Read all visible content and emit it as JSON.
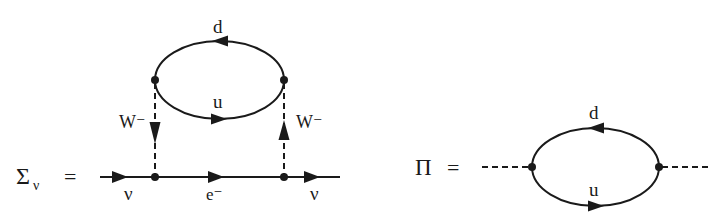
{
  "diagrams": [
    {
      "id": "self-energy",
      "lhs": {
        "symbol": "Σ",
        "subscript": "ν",
        "equals": "="
      },
      "labels": {
        "loop_top_quark": "d",
        "loop_bottom_quark": "u",
        "left_boson": "W⁻",
        "right_boson": "W⁻",
        "incoming": "ν",
        "internal": "e⁻",
        "outgoing": "ν"
      }
    },
    {
      "id": "polarization",
      "lhs": {
        "symbol": "Π",
        "equals": "="
      },
      "labels": {
        "loop_top_quark": "d",
        "loop_bottom_quark": "u"
      }
    }
  ],
  "colors": {
    "ink": "#1a1a1a",
    "background": "#ffffff"
  }
}
